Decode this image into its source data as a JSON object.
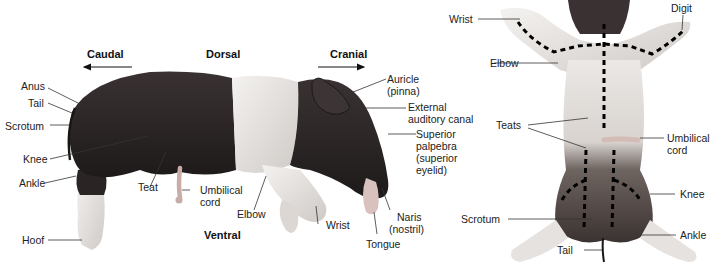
{
  "lateral_view": {
    "directions": {
      "caudal": "Caudal",
      "dorsal": "Dorsal",
      "cranial": "Cranial",
      "ventral": "Ventral"
    },
    "labels": {
      "anus": "Anus",
      "tail": "Tail",
      "scrotum": "Scrotum",
      "knee": "Knee",
      "ankle": "Ankle",
      "hoof": "Hoof",
      "teat": "Teat",
      "umbilical_cord_1": "Umbilical",
      "umbilical_cord_2": "cord",
      "elbow": "Elbow",
      "wrist": "Wrist",
      "tongue": "Tongue",
      "naris_1": "Naris",
      "naris_2": "(nostril)",
      "auricle_1": "Auricle",
      "auricle_2": "(pinna)",
      "ext_canal_1": "External",
      "ext_canal_2": "auditory canal",
      "palpebra_1": "Superior",
      "palpebra_2": "palpebra",
      "palpebra_3": "(superior",
      "palpebra_4": "eyelid)"
    }
  },
  "ventral_view": {
    "labels": {
      "wrist": "Wrist",
      "digit": "Digit",
      "elbow": "Elbow",
      "teats": "Teats",
      "umbilical_cord_1": "Umbilical",
      "umbilical_cord_2": "cord",
      "knee": "Knee",
      "scrotum": "Scrotum",
      "ankle": "Ankle",
      "tail": "Tail"
    }
  },
  "colors": {
    "dark_fur": "#2a2424",
    "white_fur": "#ece9e6",
    "pink_skin": "#d9c2bd",
    "line": "#333333"
  }
}
